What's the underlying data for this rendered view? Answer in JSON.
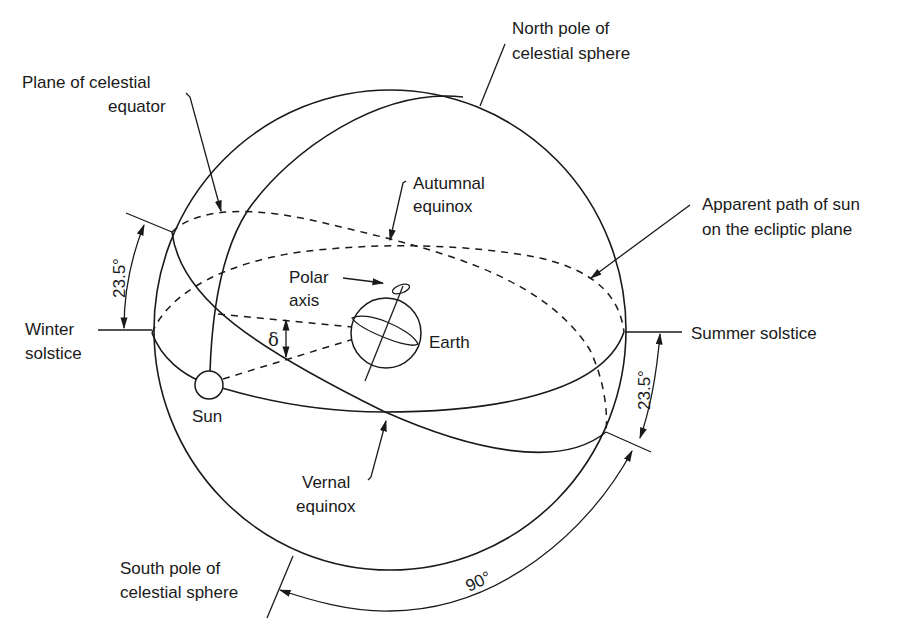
{
  "figure": {
    "labels": {
      "north_pole": [
        "North pole of",
        "celestial sphere"
      ],
      "plane_equator": [
        "Plane of celestial",
        "equator"
      ],
      "autumnal": [
        "Autumnal",
        "equinox"
      ],
      "apparent_path": [
        "Apparent path of sun",
        "on the ecliptic plane"
      ],
      "polar_axis": [
        "Polar",
        "axis"
      ],
      "winter": [
        "Winter",
        "solstice"
      ],
      "summer": "Summer solstice",
      "earth": "Earth",
      "sun": "Sun",
      "vernal": [
        "Vernal",
        "equinox"
      ],
      "south_pole": [
        "South pole of",
        "celestial sphere"
      ],
      "delta": "δ",
      "angle_left": "23.5°",
      "angle_right": "23.5°",
      "angle_bottom": "90°"
    },
    "colors": {
      "stroke": "#1a1a1a",
      "background": "#ffffff"
    }
  }
}
